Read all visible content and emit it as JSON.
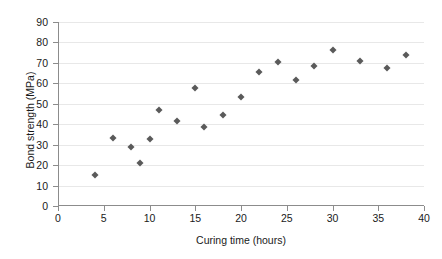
{
  "chart_data": {
    "type": "scatter",
    "title": "",
    "xlabel": "Curing time (hours)",
    "ylabel": "Bond strength (MPa)",
    "xlim": [
      0,
      40
    ],
    "ylim": [
      0,
      90
    ],
    "xticks": [
      0,
      5,
      10,
      15,
      20,
      25,
      30,
      35,
      40
    ],
    "yticks": [
      0,
      10,
      20,
      30,
      40,
      50,
      60,
      70,
      80,
      90
    ],
    "grid": "horizontal",
    "legend": "none",
    "marker": "diamond",
    "marker_color": "#5a5a5a",
    "points": [
      {
        "x": 4,
        "y": 15
      },
      {
        "x": 6,
        "y": 33.5
      },
      {
        "x": 8,
        "y": 29
      },
      {
        "x": 9,
        "y": 21
      },
      {
        "x": 10,
        "y": 32.7
      },
      {
        "x": 11,
        "y": 47
      },
      {
        "x": 13,
        "y": 41.5
      },
      {
        "x": 15,
        "y": 57.5
      },
      {
        "x": 16,
        "y": 38.8
      },
      {
        "x": 18,
        "y": 44.5
      },
      {
        "x": 20,
        "y": 53.5
      },
      {
        "x": 22,
        "y": 65.5
      },
      {
        "x": 24,
        "y": 70.5
      },
      {
        "x": 26,
        "y": 61.5
      },
      {
        "x": 28,
        "y": 68.5
      },
      {
        "x": 30,
        "y": 76.5
      },
      {
        "x": 33,
        "y": 71
      },
      {
        "x": 36,
        "y": 67.5
      },
      {
        "x": 38,
        "y": 74
      }
    ]
  },
  "axis": {
    "x_labels": [
      "0",
      "5",
      "10",
      "15",
      "20",
      "25",
      "30",
      "35",
      "40"
    ],
    "y_labels": [
      "0",
      "10",
      "20",
      "30",
      "40",
      "50",
      "60",
      "70",
      "80",
      "90"
    ],
    "x_title": "Curing time (hours)",
    "y_title": "Bond strength (MPa)"
  },
  "colors": {
    "marker": "#5a5a5a",
    "grid": "#e8e8e8",
    "axis": "#8c8c8c",
    "text": "#1a1a1a",
    "background": "#ffffff"
  }
}
